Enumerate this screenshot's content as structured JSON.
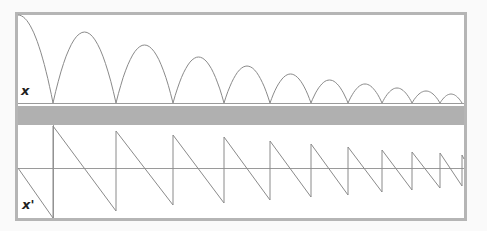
{
  "colors": {
    "frame": "#b5b5b5",
    "band": "#b0b0b0",
    "curve": "#8a8a8a",
    "axis": "#9a9a9a",
    "background": "#ffffff"
  },
  "labels": {
    "top_panel": "x",
    "bottom_panel": "x'"
  },
  "chart_data": [
    {
      "type": "line",
      "title": "",
      "ylabel": "x",
      "description": "Bouncing ball position: successive parabolic arches of decreasing height",
      "impact_x": [
        53,
        116,
        173,
        224,
        270,
        311,
        348,
        382,
        412,
        440,
        462
      ],
      "arch_peaks": [
        {
          "x": 18,
          "y": 15
        },
        {
          "x": 85,
          "y": 32
        },
        {
          "x": 145,
          "y": 45
        },
        {
          "x": 198,
          "y": 57
        },
        {
          "x": 247,
          "y": 66
        },
        {
          "x": 290,
          "y": 74
        },
        {
          "x": 329,
          "y": 80
        },
        {
          "x": 365,
          "y": 84
        },
        {
          "x": 397,
          "y": 88
        },
        {
          "x": 426,
          "y": 91
        },
        {
          "x": 451,
          "y": 94
        }
      ],
      "baseline_y": 103
    },
    {
      "type": "line",
      "title": "",
      "ylabel": "x'",
      "description": "Velocity: sawtooth with linear decrease and upward jumps at impacts",
      "zero_axis_y": 168,
      "jumps": [
        {
          "x": 53,
          "from": 218,
          "to": 126
        },
        {
          "x": 116,
          "from": 211,
          "to": 131
        },
        {
          "x": 173,
          "from": 205,
          "to": 135
        },
        {
          "x": 224,
          "from": 203,
          "to": 137
        },
        {
          "x": 270,
          "from": 200,
          "to": 141
        },
        {
          "x": 311,
          "from": 197,
          "to": 144
        },
        {
          "x": 348,
          "from": 195,
          "to": 147
        },
        {
          "x": 382,
          "from": 192,
          "to": 150
        },
        {
          "x": 412,
          "from": 190,
          "to": 152
        },
        {
          "x": 440,
          "from": 188,
          "to": 153
        },
        {
          "x": 462,
          "from": 186,
          "to": 155
        }
      ]
    }
  ]
}
